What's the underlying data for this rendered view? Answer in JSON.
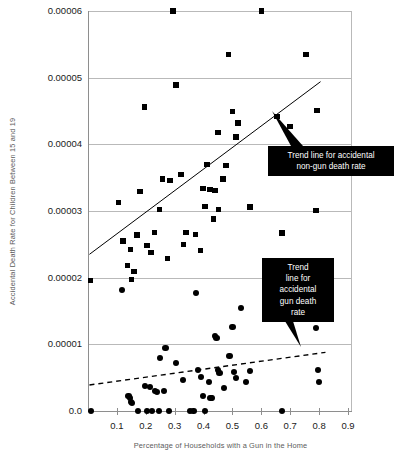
{
  "chart_data": {
    "type": "scatter",
    "title": "",
    "xlabel": "Percentage of Households with a Gun in the Home",
    "ylabel": "Accidental Death Rate for Children Between 15 and 19",
    "xlim": [
      0.0,
      0.9
    ],
    "ylim": [
      0.0,
      6e-05
    ],
    "grid": true,
    "legend_position": "annotation-callouts",
    "xticks": [
      "0.1",
      "0.2",
      "0.3",
      "0.4",
      "0.5",
      "0.6",
      "0.7",
      "0.8",
      "0.9"
    ],
    "xtick_values": [
      0.1,
      0.2,
      0.3,
      0.4,
      0.5,
      0.6,
      0.7,
      0.8,
      0.9
    ],
    "yticks": [
      "0.0",
      "0.00001",
      "0.00002",
      "0.00003",
      "0.00004",
      "0.00005",
      "0.00006"
    ],
    "ytick_values": [
      0.0,
      1e-05,
      2e-05,
      3e-05,
      4e-05,
      5e-05,
      6e-05
    ],
    "series": [
      {
        "name": "Accidental non-gun death rate",
        "marker": "square",
        "color": "#000000",
        "points": [
          [
            0.009,
            1.96e-05
          ],
          [
            0.105,
            3.13e-05
          ],
          [
            0.122,
            2.55e-05
          ],
          [
            0.136,
            2.18e-05
          ],
          [
            0.147,
            2.42e-05
          ],
          [
            0.15,
            1.97e-05
          ],
          [
            0.16,
            2.09e-05
          ],
          [
            0.17,
            2.64e-05
          ],
          [
            0.18,
            3.29e-05
          ],
          [
            0.196,
            4.56e-05
          ],
          [
            0.205,
            2.48e-05
          ],
          [
            0.218,
            2.38e-05
          ],
          [
            0.23,
            2.68e-05
          ],
          [
            0.248,
            3.02e-05
          ],
          [
            0.258,
            3.48e-05
          ],
          [
            0.275,
            2.29e-05
          ],
          [
            0.283,
            3.46e-05
          ],
          [
            0.295,
            6e-05
          ],
          [
            0.305,
            4.89e-05
          ],
          [
            0.322,
            3.55e-05
          ],
          [
            0.33,
            2.5e-05
          ],
          [
            0.34,
            2.68e-05
          ],
          [
            0.372,
            2.65e-05
          ],
          [
            0.39,
            2.41e-05
          ],
          [
            0.398,
            3.34e-05
          ],
          [
            0.405,
            3.07e-05
          ],
          [
            0.412,
            3.7e-05
          ],
          [
            0.422,
            3.32e-05
          ],
          [
            0.435,
            2.88e-05
          ],
          [
            0.44,
            3.31e-05
          ],
          [
            0.45,
            4.18e-05
          ],
          [
            0.452,
            3.02e-05
          ],
          [
            0.468,
            3.48e-05
          ],
          [
            0.478,
            3.68e-05
          ],
          [
            0.486,
            5.35e-05
          ],
          [
            0.5,
            4.49e-05
          ],
          [
            0.512,
            4.11e-05
          ],
          [
            0.52,
            4.32e-05
          ],
          [
            0.56,
            3.06e-05
          ],
          [
            0.6,
            6e-05
          ],
          [
            0.655,
            4.42e-05
          ],
          [
            0.672,
            2.67e-05
          ],
          [
            0.7,
            4.27e-05
          ],
          [
            0.755,
            5.35e-05
          ],
          [
            0.79,
            3.01e-05
          ],
          [
            0.792,
            4.51e-05
          ]
        ]
      },
      {
        "name": "Accidental gun death rate",
        "marker": "circle",
        "color": "#000000",
        "points": [
          [
            0.01,
            0.0
          ],
          [
            0.118,
            1.81e-05
          ],
          [
            0.14,
            2.3e-06
          ],
          [
            0.145,
            2e-06
          ],
          [
            0.148,
            1.4e-06
          ],
          [
            0.152,
            1.2e-06
          ],
          [
            0.172,
            0.0
          ],
          [
            0.196,
            3.8e-06
          ],
          [
            0.205,
            0.0
          ],
          [
            0.215,
            3.6e-06
          ],
          [
            0.222,
            0.0
          ],
          [
            0.232,
            3e-06
          ],
          [
            0.24,
            2.9e-06
          ],
          [
            0.245,
            0.0
          ],
          [
            0.25,
            8e-06
          ],
          [
            0.262,
            3e-06
          ],
          [
            0.268,
            9.5e-06
          ],
          [
            0.28,
            0.0
          ],
          [
            0.305,
            7.2e-06
          ],
          [
            0.33,
            4.6e-06
          ],
          [
            0.352,
            0.0
          ],
          [
            0.365,
            0.0
          ],
          [
            0.375,
            1.77e-05
          ],
          [
            0.382,
            6.2e-06
          ],
          [
            0.392,
            5.1e-06
          ],
          [
            0.398,
            2.3e-06
          ],
          [
            0.405,
            0.0
          ],
          [
            0.42,
            4.4e-06
          ],
          [
            0.424,
            2e-06
          ],
          [
            0.43,
            2e-06
          ],
          [
            0.44,
            1.13e-05
          ],
          [
            0.445,
            1.09e-05
          ],
          [
            0.45,
            6.2e-06
          ],
          [
            0.455,
            5.7e-06
          ],
          [
            0.47,
            3.4e-06
          ],
          [
            0.49,
            8.3e-06
          ],
          [
            0.5,
            1.26e-05
          ],
          [
            0.505,
            5.8e-06
          ],
          [
            0.512,
            5e-06
          ],
          [
            0.53,
            1.54e-05
          ],
          [
            0.548,
            4.3e-06
          ],
          [
            0.56,
            6e-06
          ],
          [
            0.672,
            0.0
          ],
          [
            0.79,
            1.25e-05
          ],
          [
            0.795,
            6.2e-06
          ],
          [
            0.8,
            4.4e-06
          ]
        ]
      }
    ],
    "trend_lines": [
      {
        "name": "Trend line for accidental non-gun death rate",
        "style": "solid",
        "color": "#000000",
        "x0": 0.005,
        "y0": 2.35e-05,
        "x1": 0.805,
        "y1": 4.94e-05
      },
      {
        "name": "Trend line for accidental gun death rate",
        "style": "dashed",
        "color": "#000000",
        "x0": 0.005,
        "y0": 3.9e-06,
        "x1": 0.822,
        "y1": 8.8e-06
      }
    ],
    "annotations": [
      {
        "id": "callout-nongun",
        "lines": [
          "Trend line for accidental",
          "non-gun death rate"
        ],
        "text": "Trend line for accidental non-gun death rate"
      },
      {
        "id": "callout-gun",
        "lines": [
          "Trend",
          "line for",
          "accidental",
          "gun death",
          "rate"
        ],
        "text": "Trend line for accidental gun death rate"
      }
    ]
  }
}
